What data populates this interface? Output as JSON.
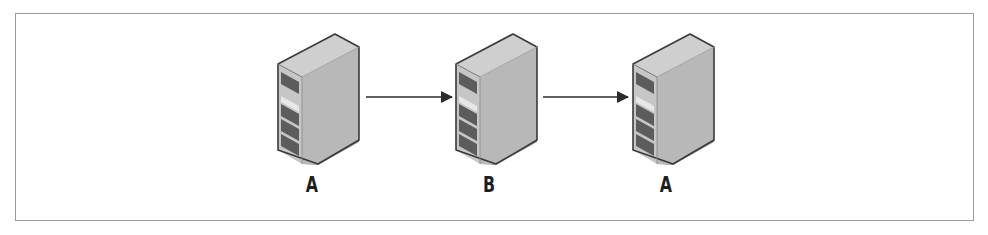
{
  "diagram": {
    "type": "flow",
    "nodes": [
      {
        "id": "server-1",
        "icon": "server-icon",
        "label": "A"
      },
      {
        "id": "server-2",
        "icon": "server-icon",
        "label": "B"
      },
      {
        "id": "server-3",
        "icon": "server-icon",
        "label": "A"
      }
    ],
    "edges": [
      {
        "from": "server-1",
        "to": "server-2",
        "style": "arrow"
      },
      {
        "from": "server-2",
        "to": "server-3",
        "style": "arrow"
      }
    ],
    "colors": {
      "frame_border": "#9a9a9a",
      "server_front": "#c4c4c4",
      "server_side": "#b3b3b3",
      "server_top": "#d0d0d0",
      "server_outline": "#3c3c3c",
      "drive_bay": "#5a5a5a",
      "arrow": "#2a2a2a",
      "label": "#1e1e1e"
    }
  }
}
